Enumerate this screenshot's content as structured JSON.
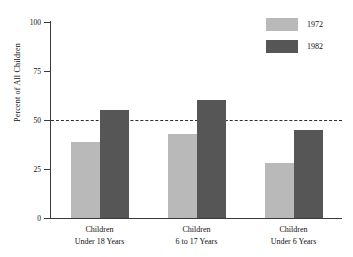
{
  "chart_data": {
    "type": "bar",
    "title": "",
    "subtitle": "",
    "xlabel": "",
    "ylabel": "Percent of All Children",
    "ylim": [
      0,
      100
    ],
    "yticks": [
      0,
      25,
      50,
      75,
      100
    ],
    "ytick_labels": [
      "0",
      "25",
      "50",
      "75",
      "100"
    ],
    "grid": false,
    "legend_position": "top-right",
    "categories": [
      "Children Under 18 Years",
      "Children 6 to 17 Years",
      "Children Under 6 Years"
    ],
    "category_lines": [
      {
        "line1": "Children",
        "line2": "Under 18 Years"
      },
      {
        "line1": "Children",
        "line2": "6 to 17 Years"
      },
      {
        "line1": "Children",
        "line2": "Under 6 Years"
      }
    ],
    "series": [
      {
        "name": "1972",
        "color": "#b9b9b9",
        "values": [
          39,
          43,
          28
        ]
      },
      {
        "name": "1982",
        "color": "#565656",
        "values": [
          55,
          60,
          45
        ]
      }
    ],
    "annotations": [
      {
        "name": "fifty-percent-reference-line",
        "type": "hline",
        "value": 50,
        "style": "dashed",
        "color": "#2f2f2f"
      }
    ]
  },
  "legend": {
    "entries": [
      {
        "label": "1972",
        "color": "#b9b9b9"
      },
      {
        "label": "1982",
        "color": "#565656"
      }
    ]
  },
  "axis": {
    "y_title": "Percent of All Children"
  },
  "colors": {
    "series_1972": "#b9b9b9",
    "series_1982": "#565656",
    "axis": "#3a3a3a",
    "reference_line": "#2f2f2f",
    "background": "#ffffff"
  }
}
